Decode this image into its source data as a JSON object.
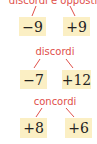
{
  "groups": [
    {
      "label": "discordi e opposti",
      "left": "−9",
      "right": "+9"
    },
    {
      "label": "discordi",
      "left": "−7",
      "right": "+12"
    },
    {
      "label": "concordi",
      "left": "+8",
      "right": "+6"
    }
  ],
  "colors": {
    "label": "#e0504a",
    "box": "#fbefc4"
  }
}
